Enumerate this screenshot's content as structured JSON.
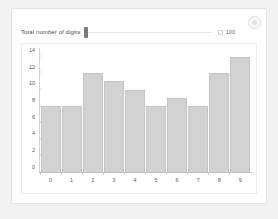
{
  "controls": {
    "slider_label": "Total number of digits",
    "slider_value": 0,
    "max_checkbox_name": "max-checkbox",
    "max_value": "100"
  },
  "icons": {
    "settings": "gear-icon"
  },
  "chart_data": {
    "type": "bar",
    "title": "",
    "xlabel": "",
    "ylabel": "",
    "categories": [
      "0",
      "1",
      "2",
      "3",
      "4",
      "5",
      "6",
      "7",
      "8",
      "9"
    ],
    "values": [
      8,
      8,
      12,
      11,
      10,
      8,
      9,
      8,
      12,
      14
    ],
    "yticks": [
      0,
      2,
      4,
      6,
      8,
      10,
      12,
      14
    ],
    "ylim": [
      0,
      14.8
    ],
    "grid": false,
    "legend": null,
    "bar_fill": "#d2d2d2",
    "bar_border": "#c4c4c4"
  }
}
